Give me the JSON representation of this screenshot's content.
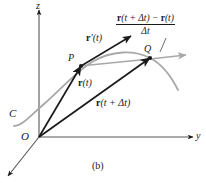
{
  "figure": {
    "caption": "(b)",
    "axes": {
      "z_label": "z",
      "y_label": "y",
      "origin_label": "O"
    },
    "curve": {
      "name_label": "C",
      "color": "#a8a8a8"
    },
    "points": [
      {
        "id": "P",
        "label": "P"
      },
      {
        "id": "Q",
        "label": "Q"
      }
    ],
    "vectors": {
      "tangent": {
        "label_bold": "r",
        "label_rest": "′(t)",
        "color": "#1a1a1a"
      },
      "position_t": {
        "label_bold": "r",
        "label_rest": "(t)",
        "color": "#1a1a1a"
      },
      "position_t_plus_dt": {
        "label_bold": "r",
        "label_rest": "(t + Δt)",
        "color": "#1a1a1a"
      },
      "secant": {
        "color": "#a8a8a8"
      }
    },
    "difference_quotient": {
      "numerator_part1_bold": "r",
      "numerator_part1_rest": "(t + Δt) − ",
      "numerator_part2_bold": "r",
      "numerator_part2_rest": "(t)",
      "denominator": "Δt"
    },
    "colors": {
      "ink": "#1a1a1a",
      "gray": "#a8a8a8",
      "background": "#ffffff"
    }
  }
}
